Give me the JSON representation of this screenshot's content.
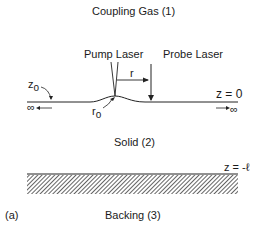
{
  "labels": {
    "gas": "Coupling Gas (1)",
    "pump": "Pump Laser",
    "probe": "Probe Laser",
    "z0_label": "z",
    "z0_sub": "o",
    "r": "r",
    "r0_label": "r",
    "r0_sub": "o",
    "z_eq_0": "z = 0",
    "inf_left": "∞",
    "inf_right": "∞",
    "solid": "Solid (2)",
    "z_eq_l": "z = -ℓ",
    "panel": "(a)",
    "backing": "Backing (3)"
  }
}
